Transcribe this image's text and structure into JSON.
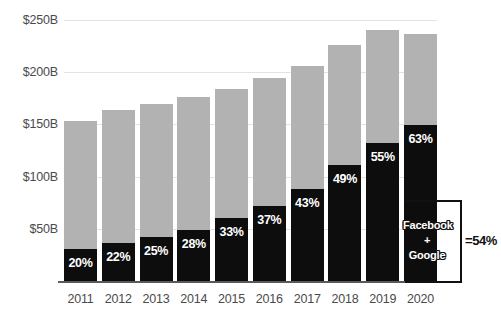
{
  "chart_data": {
    "type": "bar",
    "title": "",
    "subtitle": "",
    "xlabel": "",
    "ylabel": "",
    "ylim": [
      0,
      250
    ],
    "grid": true,
    "legend_position": "none",
    "stacked": true,
    "y_unit": "B",
    "y_ticks": [
      "$50B",
      "$100B",
      "$150B",
      "$200B",
      "$250B"
    ],
    "y_tick_values": [
      50,
      100,
      150,
      200,
      250
    ],
    "categories": [
      "2011",
      "2012",
      "2013",
      "2014",
      "2015",
      "2016",
      "2017",
      "2018",
      "2019",
      "2020"
    ],
    "series": [
      {
        "name": "Facebook + Google",
        "color": "#0d0d0d",
        "values": [
          30.6,
          36.1,
          40.3,
          43.7,
          48.3,
          55.5,
          66.3,
          79.2,
          92.4,
          111.3
        ],
        "labels": [
          "20%",
          "22%",
          "25%",
          "28%",
          "33%",
          "37%",
          "43%",
          "49%",
          "55%",
          "63%"
        ]
      },
      {
        "name": "Other digital ad spend",
        "color": "#b2b2b2",
        "values": [
          122.4,
          128.0,
          120.9,
          112.3,
          98.1,
          94.5,
          87.9,
          82.4,
          75.6,
          65.4
        ]
      }
    ],
    "totals": [
      153,
      164,
      161,
      156,
      146,
      150,
      154,
      162,
      168,
      177
    ],
    "bar_tops_percent_of_total": [
      20,
      22,
      25,
      28,
      33,
      37,
      43,
      49,
      55,
      63
    ],
    "annotation": {
      "label_lines": [
        "Facebook",
        "+",
        "Google"
      ],
      "result": "=54%"
    }
  },
  "bars": [
    {
      "year": "2011",
      "total": 153,
      "black_pct": 20,
      "label": "20%"
    },
    {
      "year": "2012",
      "total": 164,
      "black_pct": 22,
      "label": "22%"
    },
    {
      "year": "2013",
      "total": 170,
      "black_pct": 25,
      "label": "25%"
    },
    {
      "year": "2014",
      "total": 176,
      "black_pct": 28,
      "label": "28%"
    },
    {
      "year": "2015",
      "total": 184,
      "black_pct": 33,
      "label": "33%"
    },
    {
      "year": "2016",
      "total": 194,
      "black_pct": 37,
      "label": "37%"
    },
    {
      "year": "2017",
      "total": 206,
      "black_pct": 43,
      "label": "43%"
    },
    {
      "year": "2018",
      "total": 226,
      "black_pct": 49,
      "label": "49%"
    },
    {
      "year": "2019",
      "total": 240,
      "black_pct": 55,
      "label": "55%"
    },
    {
      "year": "2020",
      "total": 237,
      "black_pct": 63,
      "label": "63%"
    }
  ],
  "y_axis": {
    "ticks": [
      {
        "label": "$250B",
        "value": 250
      },
      {
        "label": "$200B",
        "value": 200
      },
      {
        "label": "$150B",
        "value": 150
      },
      {
        "label": "$100B",
        "value": 100
      },
      {
        "label": "$50B",
        "value": 50
      }
    ]
  },
  "annotation": {
    "line1": "Facebook",
    "line2": "+",
    "line3": "Google",
    "result": "=54%"
  },
  "colors": {
    "black_series": "#0d0d0d",
    "gray_series": "#b2b2b2",
    "gridline": "#e3e3e3",
    "axis": "#5a5a5a",
    "tick_text": "#4a4a4a",
    "background": "#ffffff"
  }
}
